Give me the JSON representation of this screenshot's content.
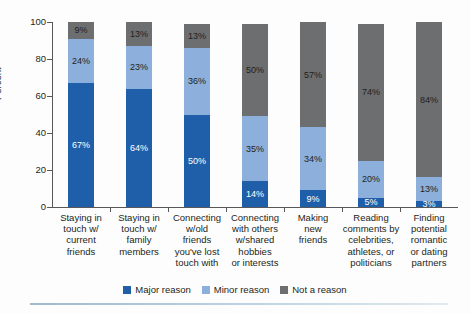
{
  "chart_data": {
    "type": "bar",
    "subtype": "stacked-bar-100",
    "title": "",
    "xlabel": "",
    "ylabel": "Percent",
    "ylim": [
      0,
      100
    ],
    "yticks": [
      0,
      20,
      40,
      60,
      80,
      100
    ],
    "ytick_labels": [
      "0",
      "20",
      "40",
      "60",
      "80",
      "100"
    ],
    "grid": false,
    "legend_position": "bottom",
    "value_suffix": "%",
    "categories": [
      "Staying in touch w/ current friends",
      "Staying in touch w/ family members",
      "Connecting w/old friends you've lost touch with",
      "Connecting with others w/shared hobbies or interests",
      "Making new friends",
      "Reading comments by celebrities, athletes, or politicians",
      "Finding potential romantic or dating partners"
    ],
    "category_lines": [
      [
        "Staying in",
        "touch w/",
        "current",
        "friends"
      ],
      [
        "Staying in",
        "touch w/",
        "family",
        "members"
      ],
      [
        "Connecting",
        "w/old",
        "friends",
        "you've lost",
        "touch with"
      ],
      [
        "Connecting",
        "with others",
        "w/shared",
        "hobbies",
        "or interests"
      ],
      [
        "Making",
        "new",
        "friends"
      ],
      [
        "Reading",
        "comments by",
        "celebrities,",
        "athletes, or",
        "politicians"
      ],
      [
        "Finding",
        "potential",
        "romantic",
        "or dating",
        "partners"
      ]
    ],
    "series": [
      {
        "name": "Major reason",
        "color": "#1f5fa9",
        "values": [
          67,
          64,
          50,
          14,
          9,
          5,
          3
        ],
        "labels": [
          "67%",
          "64%",
          "50%",
          "14%",
          "9%",
          "5%",
          "3%"
        ]
      },
      {
        "name": "Minor reason",
        "color": "#8cafdb",
        "values": [
          24,
          23,
          36,
          35,
          34,
          20,
          13
        ],
        "labels": [
          "24%",
          "23%",
          "36%",
          "35%",
          "34%",
          "20%",
          "13%"
        ]
      },
      {
        "name": "Not a reason",
        "color": "#6d6e70",
        "values": [
          9,
          13,
          13,
          50,
          57,
          74,
          84
        ],
        "labels": [
          "9%",
          "13%",
          "13%",
          "50%",
          "57%",
          "74%",
          "84%"
        ]
      }
    ]
  },
  "legend": {
    "items": [
      {
        "label": "Major reason",
        "color": "#1f5fa9"
      },
      {
        "label": "Minor reason",
        "color": "#8cafdb"
      },
      {
        "label": "Not a reason",
        "color": "#6d6e70"
      }
    ]
  },
  "axis": {
    "y_title": "Percent"
  }
}
